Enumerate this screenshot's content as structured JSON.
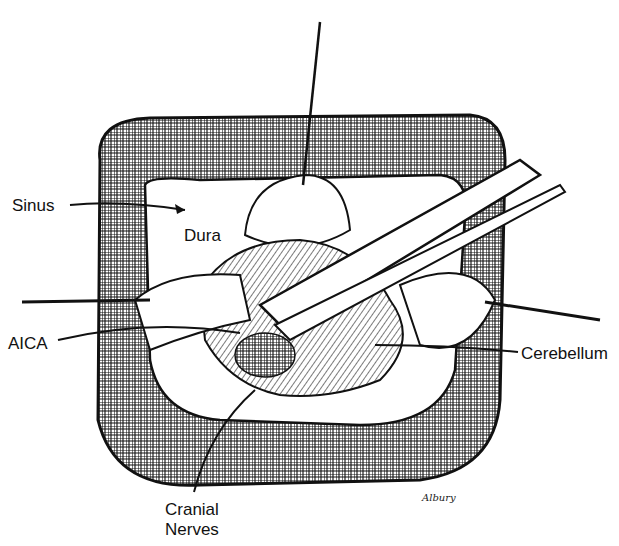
{
  "figure": {
    "labels": {
      "sinus": "Sinus",
      "dura": "Dura",
      "aica": "AICA",
      "cerebellum": "Cerebellum",
      "cranial_nerves_line1": "Cranial",
      "cranial_nerves_line2": "Nerves"
    },
    "signature": "Albury"
  }
}
